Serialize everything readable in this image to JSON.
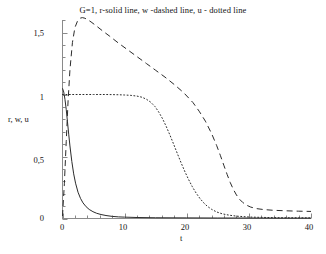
{
  "chart_data": {
    "type": "line",
    "title": "G=1, r-solid line, w -dashed line, u - dotted line",
    "xlabel": "t",
    "ylabel": "r, w, u",
    "xlim": [
      0,
      40
    ],
    "ylim": [
      0,
      1.75
    ],
    "grid": false,
    "legend_position": "title",
    "xticks": [
      0,
      10,
      20,
      30,
      40
    ],
    "xtick_labels": [
      "0",
      "10",
      "20",
      "30",
      "40"
    ],
    "xminor_tick_step": 2,
    "yticks": [
      0,
      0.5,
      1,
      1.5
    ],
    "ytick_labels": [
      "0",
      "0,5",
      "1",
      "1,5"
    ],
    "yminor_tick_step": 0.1,
    "decimal_separator": ",",
    "series": [
      {
        "name": "r",
        "style": "solid",
        "color": "#2b2b2b",
        "x": [
          0,
          0.2,
          0.4,
          0.6,
          0.8,
          1.0,
          1.2,
          1.5,
          1.8,
          2.1,
          2.5,
          2.9,
          3.3,
          3.8,
          4.3,
          4.9,
          5.5,
          6.2,
          7.0,
          8.0,
          9.0,
          10.0,
          12.0,
          15.0,
          20.0,
          25.0,
          30.0,
          35.0,
          40.0
        ],
        "y": [
          1.05,
          1.02,
          0.96,
          0.88,
          0.78,
          0.68,
          0.585,
          0.46,
          0.36,
          0.285,
          0.212,
          0.162,
          0.126,
          0.095,
          0.073,
          0.055,
          0.042,
          0.032,
          0.024,
          0.017,
          0.013,
          0.011,
          0.008,
          0.006,
          0.005,
          0.004,
          0.004,
          0.003,
          0.003
        ]
      },
      {
        "name": "w",
        "style": "dashed",
        "color": "#2b2b2b",
        "x": [
          0,
          0.3,
          0.6,
          0.9,
          1.2,
          1.6,
          2.0,
          2.4,
          2.8,
          3.2,
          3.6,
          4.0,
          4.6,
          5.4,
          6.4,
          7.6,
          9.0,
          10.5,
          12.0,
          13.5,
          15.0,
          16.5,
          18.0,
          19.5,
          21.0,
          22.0,
          23.0,
          24.0,
          24.8,
          25.4,
          26.0,
          26.5,
          27.0,
          27.5,
          28.0,
          28.5,
          29.0,
          29.6,
          30.3,
          31.2,
          32.4,
          34.0,
          36.0,
          38.0,
          40.0
        ],
        "y": [
          0.02,
          0.28,
          0.62,
          0.95,
          1.2,
          1.42,
          1.54,
          1.59,
          1.615,
          1.62,
          1.615,
          1.605,
          1.585,
          1.555,
          1.515,
          1.47,
          1.415,
          1.36,
          1.305,
          1.25,
          1.195,
          1.14,
          1.08,
          1.015,
          0.935,
          0.865,
          0.785,
          0.685,
          0.59,
          0.51,
          0.425,
          0.355,
          0.29,
          0.235,
          0.19,
          0.155,
          0.13,
          0.108,
          0.092,
          0.08,
          0.072,
          0.066,
          0.062,
          0.059,
          0.057
        ]
      },
      {
        "name": "u",
        "style": "dotted",
        "color": "#2b2b2b",
        "x": [
          0,
          1,
          2,
          3,
          4,
          5,
          6,
          7,
          8,
          9,
          10,
          11,
          12,
          12.8,
          13.5,
          14.2,
          14.9,
          15.5,
          16.1,
          16.7,
          17.3,
          17.9,
          18.5,
          19.1,
          19.7,
          20.3,
          20.9,
          21.5,
          22.1,
          22.7,
          23.3,
          24.0,
          24.8,
          25.7,
          26.8,
          28.0,
          30.0,
          32.0,
          34.0,
          36.0,
          38.0,
          40.0
        ],
        "y": [
          1.0,
          1.0,
          1.0,
          1.0,
          1.0,
          1.0,
          1.0,
          1.0,
          0.999,
          0.998,
          0.996,
          0.993,
          0.987,
          0.978,
          0.962,
          0.938,
          0.902,
          0.858,
          0.805,
          0.742,
          0.672,
          0.598,
          0.522,
          0.448,
          0.378,
          0.314,
          0.256,
          0.206,
          0.163,
          0.128,
          0.099,
          0.074,
          0.053,
          0.038,
          0.027,
          0.019,
          0.012,
          0.009,
          0.007,
          0.006,
          0.006,
          0.005
        ]
      }
    ]
  },
  "axes": {
    "ytick_0": "0",
    "ytick_1": "0,5",
    "ytick_2": "1",
    "ytick_3": "1,5",
    "xtick_0": "0",
    "xtick_1": "10",
    "xtick_2": "20",
    "xtick_3": "30",
    "xtick_4": "40"
  }
}
